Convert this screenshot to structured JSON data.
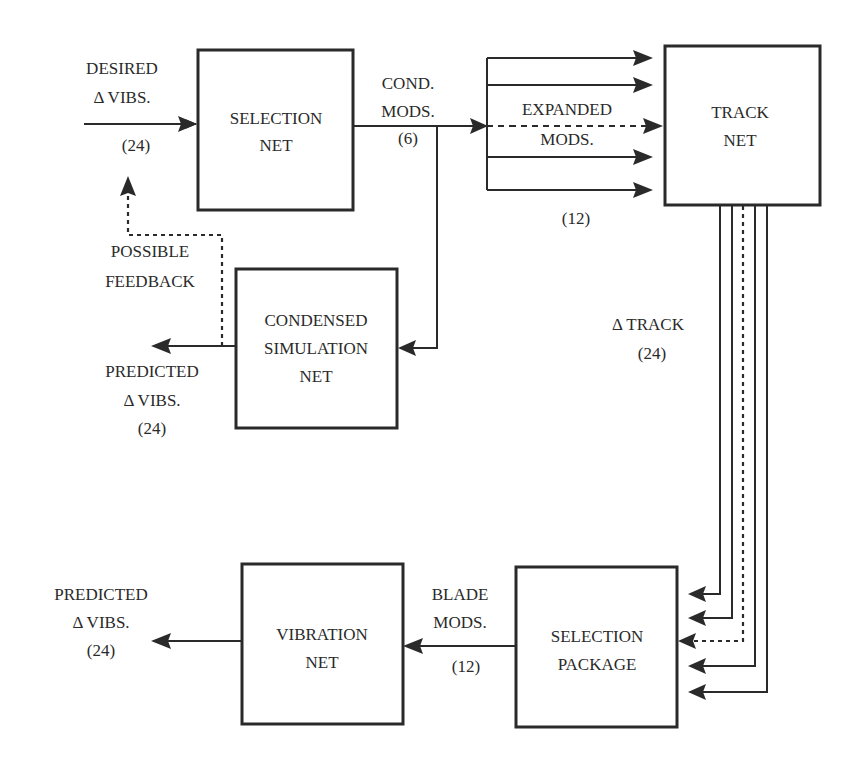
{
  "diagram": {
    "boxes": {
      "selection_net": {
        "line1": "SELECTION",
        "line2": "NET"
      },
      "track_net": {
        "line1": "TRACK",
        "line2": "NET"
      },
      "condensed_sim": {
        "line1": "CONDENSED",
        "line2": "SIMULATION",
        "line3": "NET"
      },
      "selection_package": {
        "line1": "SELECTION",
        "line2": "PACKAGE"
      },
      "vibration_net": {
        "line1": "VIBRATION",
        "line2": "NET"
      }
    },
    "labels": {
      "desired_vibs": {
        "line1": "DESIRED",
        "line2": "Δ VIBS.",
        "count": "(24)"
      },
      "cond_mods": {
        "line1": "COND.",
        "line2": "MODS.",
        "count": "(6)"
      },
      "expanded_mods": {
        "line1": "EXPANDED",
        "line2": "MODS.",
        "count": "(12)"
      },
      "possible_feedback": {
        "line1": "POSSIBLE",
        "line2": "FEEDBACK"
      },
      "predicted_vibs_top": {
        "line1": "PREDICTED",
        "line2": "Δ VIBS.",
        "count": "(24)"
      },
      "delta_track": {
        "line1": "Δ TRACK",
        "count": "(24)"
      },
      "blade_mods": {
        "line1": "BLADE",
        "line2": "MODS.",
        "count": "(12)"
      },
      "predicted_vibs_bottom": {
        "line1": "PREDICTED",
        "line2": "Δ VIBS.",
        "count": "(24)"
      }
    }
  }
}
